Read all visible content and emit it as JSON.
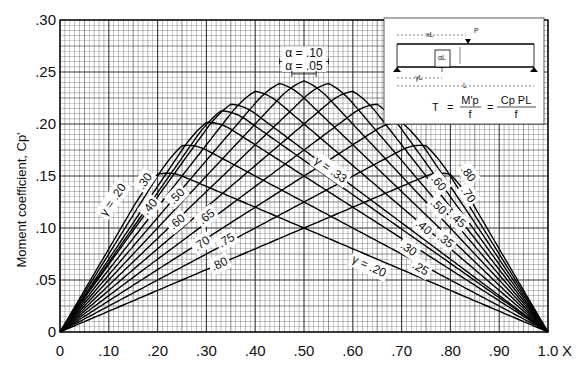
{
  "chart_data": {
    "type": "line",
    "title": "",
    "xlabel": "X",
    "ylabel": "Moment coefficient, Cp'",
    "xlim": [
      0,
      1.0
    ],
    "ylim": [
      0,
      0.3
    ],
    "grid": true,
    "x_ticks": [
      "0",
      ".10",
      ".20",
      ".30",
      ".40",
      ".50",
      ".60",
      ".70",
      ".80",
      ".90",
      "1.0"
    ],
    "x_tick_values": [
      0,
      0.1,
      0.2,
      0.3,
      0.4,
      0.5,
      0.6,
      0.7,
      0.8,
      0.9,
      1.0
    ],
    "y_ticks": [
      "0",
      ".05",
      ".10",
      ".15",
      ".20",
      ".25",
      ".30"
    ],
    "y_tick_values": [
      0,
      0.05,
      0.1,
      0.15,
      0.2,
      0.25,
      0.3
    ],
    "series": [
      {
        "name": "γ = .20",
        "gamma": 0.2,
        "peak": 0.155
      },
      {
        "name": "γ = .25",
        "gamma": 0.25,
        "peak": 0.182
      },
      {
        "name": "γ = .30",
        "gamma": 0.3,
        "peak": 0.205
      },
      {
        "name": "γ = .33",
        "gamma": 0.33,
        "peak": 0.216
      },
      {
        "name": "γ = .35",
        "gamma": 0.35,
        "peak": 0.222
      },
      {
        "name": "γ = .40",
        "gamma": 0.4,
        "peak": 0.235
      },
      {
        "name": "γ = .45",
        "gamma": 0.45,
        "peak": 0.242
      },
      {
        "name": "γ = .50",
        "gamma": 0.5,
        "peak": 0.244
      },
      {
        "name": "γ = .55",
        "gamma": 0.55,
        "peak": 0.242
      },
      {
        "name": "γ = .60",
        "gamma": 0.6,
        "peak": 0.235
      },
      {
        "name": "γ = .65",
        "gamma": 0.65,
        "peak": 0.222
      },
      {
        "name": "γ = .70",
        "gamma": 0.7,
        "peak": 0.205
      },
      {
        "name": "γ = .75",
        "gamma": 0.75,
        "peak": 0.182
      },
      {
        "name": "γ = .80",
        "gamma": 0.8,
        "peak": 0.155
      }
    ],
    "curve_labels_left": [
      {
        "text": "γ = .20",
        "x": 0.115,
        "y": 0.125,
        "angle": -55
      },
      {
        "text": ".30",
        "x": 0.18,
        "y": 0.143,
        "angle": -55
      },
      {
        "text": ".40",
        "x": 0.19,
        "y": 0.118,
        "angle": -50
      },
      {
        "text": ".50",
        "x": 0.245,
        "y": 0.128,
        "angle": -45
      },
      {
        "text": ".60",
        "x": 0.245,
        "y": 0.103,
        "angle": -40
      },
      {
        "text": ".65",
        "x": 0.305,
        "y": 0.108,
        "angle": -38
      },
      {
        "text": ".70",
        "x": 0.295,
        "y": 0.082,
        "angle": -35
      },
      {
        "text": ".75",
        "x": 0.345,
        "y": 0.085,
        "angle": -30
      },
      {
        "text": ".80",
        "x": 0.33,
        "y": 0.062,
        "angle": -25
      }
    ],
    "curve_labels_right": [
      {
        "text": "γ = .33",
        "x": 0.55,
        "y": 0.153,
        "angle": 35
      },
      {
        "text": ".80",
        "x": 0.83,
        "y": 0.15,
        "angle": 55
      },
      {
        "text": ".70",
        "x": 0.83,
        "y": 0.13,
        "angle": 55
      },
      {
        "text": ".60",
        "x": 0.77,
        "y": 0.141,
        "angle": 50
      },
      {
        "text": ".50",
        "x": 0.77,
        "y": 0.118,
        "angle": 45
      },
      {
        "text": ".45",
        "x": 0.81,
        "y": 0.105,
        "angle": 42
      },
      {
        "text": ".40",
        "x": 0.74,
        "y": 0.098,
        "angle": 40
      },
      {
        "text": ".35",
        "x": 0.785,
        "y": 0.085,
        "angle": 38
      },
      {
        "text": ".30",
        "x": 0.71,
        "y": 0.077,
        "angle": 35
      },
      {
        "text": ".25",
        "x": 0.735,
        "y": 0.058,
        "angle": 30
      },
      {
        "text": "γ = .20",
        "x": 0.63,
        "y": 0.06,
        "angle": 25
      }
    ],
    "annotations": [
      {
        "text": "α = .10",
        "x": 0.5,
        "y": 0.264
      },
      {
        "text": "α = .05",
        "x": 0.5,
        "y": 0.252
      }
    ],
    "inset": {
      "labels": {
        "xL": "xL",
        "P": "P",
        "aL": "αL",
        "T": "T",
        "yL": "γL",
        "L": "L"
      },
      "formula": {
        "lhs": "T",
        "eq": "=",
        "num1": "M'p",
        "den1": "f",
        "num2": "Cp PL",
        "den2": "f"
      }
    }
  }
}
